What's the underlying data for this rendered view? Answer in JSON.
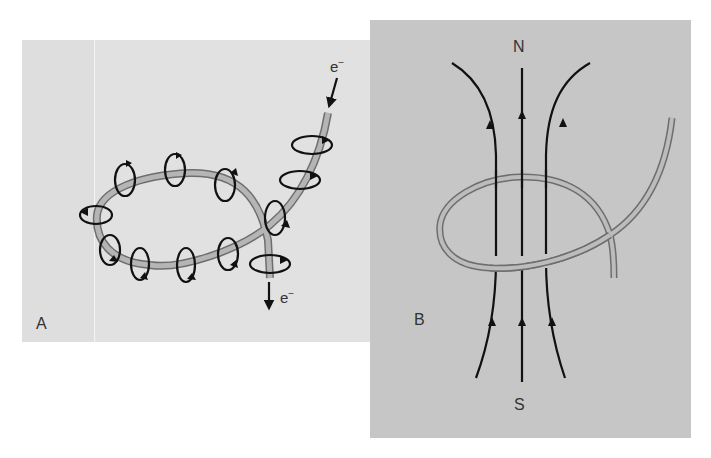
{
  "figure": {
    "panels": [
      {
        "id": "A",
        "label": "A",
        "description": "Current-carrying wire loop with circular magnetic field around the wire",
        "electron_in_label": "e",
        "electron_in_sup": "−",
        "electron_out_label": "e",
        "electron_out_sup": "−",
        "background": "#e1e1e1"
      },
      {
        "id": "B",
        "label": "B",
        "description": "Magnetic field lines through wire loop from S to N",
        "north_label": "N",
        "south_label": "S",
        "background": "#c6c6c6"
      }
    ],
    "colors": {
      "wire_fill": "#b5b5b5",
      "wire_edge": "#6e6e6e",
      "field_line": "#111111"
    }
  }
}
